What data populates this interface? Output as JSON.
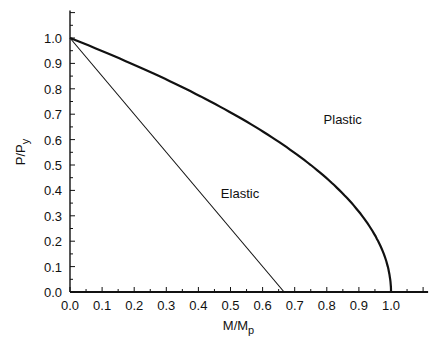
{
  "chart_data": {
    "type": "line",
    "title": "",
    "xlabel": "M/M",
    "xlabel_sub": "p",
    "ylabel": "P/P",
    "ylabel_sub": "y",
    "xlim": [
      0.0,
      1.1
    ],
    "ylim": [
      0.0,
      1.1
    ],
    "xticks": [
      "0.0",
      "0.1",
      "0.2",
      "0.3",
      "0.4",
      "0.5",
      "0.6",
      "0.7",
      "0.8",
      "0.9",
      "1.0"
    ],
    "yticks": [
      "0.0",
      "0.1",
      "0.2",
      "0.3",
      "0.4",
      "0.5",
      "0.6",
      "0.7",
      "0.8",
      "0.9",
      "1.0"
    ],
    "minor_tick_step": 0.05,
    "grid": false,
    "legend": "none (inline curve labels)",
    "series": [
      {
        "name": "Plastic",
        "equation": "M/Mp = 1 - (P/Py)^2",
        "x": [
          0.0,
          0.19,
          0.36,
          0.51,
          0.64,
          0.75,
          0.84,
          0.91,
          0.96,
          0.99,
          1.0
        ],
        "y": [
          1.0,
          0.9,
          0.8,
          0.7,
          0.6,
          0.5,
          0.4,
          0.3,
          0.2,
          0.1,
          0.0
        ],
        "line_weight": "thick"
      },
      {
        "name": "Elastic",
        "equation": "P/Py + 1.5 M/Mp = 1",
        "x": [
          0.0,
          0.667
        ],
        "y": [
          1.0,
          0.0
        ],
        "line_weight": "thin"
      }
    ],
    "annotations": [
      {
        "text": "Plastic",
        "x": 0.79,
        "y": 0.66
      },
      {
        "text": "Elastic",
        "x": 0.47,
        "y": 0.37
      }
    ]
  }
}
